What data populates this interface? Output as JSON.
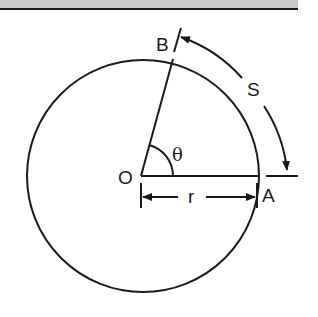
{
  "figure": {
    "labels": {
      "center": "O",
      "point_a": "A",
      "point_b": "B",
      "radius": "r",
      "arc_length": "S",
      "angle": "θ"
    },
    "colors": {
      "stroke": "#1a1a1a",
      "header_bar": "#c8c8c8",
      "background": "#ffffff"
    }
  }
}
